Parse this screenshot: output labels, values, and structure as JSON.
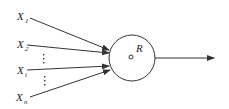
{
  "diagram": {
    "type": "neuron-model",
    "inputs": [
      {
        "label": "X",
        "subscript": "1"
      },
      {
        "label": "X",
        "subscript": "2"
      },
      {
        "label": "X",
        "subscript": "i"
      },
      {
        "label": "X",
        "subscript": "n"
      }
    ],
    "ellipsis": "⋮",
    "node": {
      "label": "R"
    },
    "output": {
      "label": ""
    },
    "colors": {
      "stroke": "#333333",
      "background": "#ffffff"
    }
  }
}
